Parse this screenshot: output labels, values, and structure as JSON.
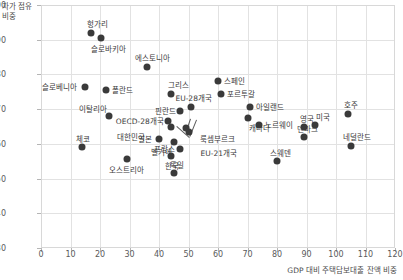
{
  "chart_data": {
    "type": "scatter",
    "title": "",
    "xlabel": "GDP 대비 주택담보대출 잔액 비중",
    "ylabel": "자가 점유 비중",
    "xlim": [
      0,
      120
    ],
    "ylim": [
      30,
      100
    ],
    "xticks": [
      0,
      10,
      20,
      30,
      40,
      50,
      60,
      70,
      80,
      90,
      100,
      110,
      120
    ],
    "yticks": [
      30,
      40,
      50,
      60,
      70,
      80,
      90,
      100
    ],
    "grid": true,
    "legend": "none",
    "marker_color": "#3a3a3a",
    "points": [
      {
        "label": "헝가리",
        "x": 17,
        "y": 92.0,
        "lx": -4,
        "ly": -13
      },
      {
        "label": "슬로바키아",
        "x": 20.5,
        "y": 90.5,
        "lx": -10,
        "ly": 7
      },
      {
        "label": "에스토니아",
        "x": 36,
        "y": 82.0,
        "lx": -12,
        "ly": -13
      },
      {
        "label": "슬로베니아",
        "x": 15,
        "y": 76.5,
        "lx": -43,
        "ly": -4
      },
      {
        "label": "폴란드",
        "x": 22,
        "y": 75.5,
        "lx": 6,
        "ly": -4
      },
      {
        "label": "그리스",
        "x": 44,
        "y": 74.5,
        "lx": -3,
        "ly": -13
      },
      {
        "label": "스페인",
        "x": 60,
        "y": 78.0,
        "lx": 6,
        "ly": -4
      },
      {
        "label": "포르투갈",
        "x": 61,
        "y": 74.5,
        "lx": 6,
        "ly": -4
      },
      {
        "label": "이탈리아",
        "x": 23,
        "y": 68.0,
        "lx": -30,
        "ly": -11
      },
      {
        "label": "아일랜드",
        "x": 71,
        "y": 70.5,
        "lx": 6,
        "ly": -4
      },
      {
        "label": "호주",
        "x": 104,
        "y": 68.5,
        "lx": -4,
        "ly": -13
      },
      {
        "label": "EU-28개국",
        "x": 51,
        "y": 70.5,
        "lx": -16,
        "ly": -13
      },
      {
        "label": "핀란드",
        "x": 47,
        "y": 69.5,
        "lx": -25,
        "ly": -4
      },
      {
        "label": "캐나다",
        "x": 70,
        "y": 67.5,
        "lx": 1,
        "ly": 6
      },
      {
        "label": "노르웨이",
        "x": 74,
        "y": 65.5,
        "lx": 6,
        "ly": -4
      },
      {
        "label": "영국",
        "x": 89,
        "y": 65.0,
        "lx": -4,
        "ly": -12
      },
      {
        "label": "미국",
        "x": 93,
        "y": 65.5,
        "lx": 1,
        "ly": -12
      },
      {
        "label": "OECD-28개국",
        "x": 43,
        "y": 66.5,
        "lx": -52,
        "ly": -4
      },
      {
        "label": "대한민국",
        "x": 44,
        "y": 65.0,
        "lx": -54,
        "ly": 6
      },
      {
        "label": "룩셈부르크",
        "x": 49,
        "y": 64.5,
        "lx": 14,
        "ly": 7
      },
      {
        "label": "EU-21개국",
        "x": 50,
        "y": 63.5,
        "lx": 12,
        "ly": 17
      },
      {
        "label": "네덜란드",
        "x": 105,
        "y": 59.5,
        "lx": -8,
        "ly": -13
      },
      {
        "label": "체코",
        "x": 14,
        "y": 59.0,
        "lx": -6,
        "ly": -12
      },
      {
        "label": "일본",
        "x": 40,
        "y": 61.5,
        "lx": -21,
        "ly": -4
      },
      {
        "label": "벨기에",
        "x": 45,
        "y": 60.5,
        "lx": -23,
        "ly": 6
      },
      {
        "label": "프랑스",
        "x": 47,
        "y": 58.5,
        "lx": -26,
        "ly": -4
      },
      {
        "label": "한국",
        "x": 44,
        "y": 56.5,
        "lx": -6,
        "ly": 6
      },
      {
        "label": "오스트리아",
        "x": 29,
        "y": 55.5,
        "lx": -18,
        "ly": 7
      },
      {
        "label": "독일",
        "x": 45,
        "y": 51.5,
        "lx": -4,
        "ly": -12
      },
      {
        "label": "스웨덴",
        "x": 80,
        "y": 55.0,
        "lx": -7,
        "ly": -12
      },
      {
        "label": "덴마크",
        "x": 89,
        "y": 62.0,
        "lx": -7,
        "ly": -12
      }
    ],
    "leaders": [
      {
        "from_x": 51,
        "from_y": 67.3,
        "to_x": 49.8,
        "to_y": 64.3
      },
      {
        "from_x": 53,
        "from_y": 67.0,
        "to_x": 50.8,
        "to_y": 62.3
      },
      {
        "from_x": 46,
        "from_y": 65.2,
        "to_x": 50.3,
        "to_y": 62.0
      }
    ]
  }
}
